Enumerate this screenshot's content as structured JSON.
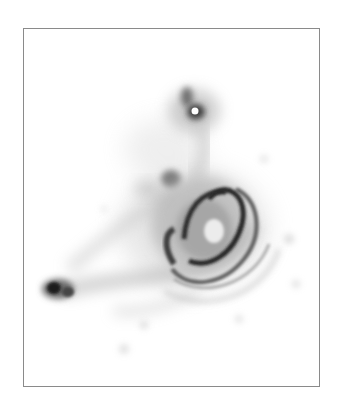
{
  "image": {
    "caption": "",
    "subject": "inverted-grayscale spiral galaxy with tidal tail and companion",
    "colors": {
      "background": "#ffffff",
      "frame": "#8a8a8a",
      "ink_dark": "#1a1a1a",
      "ink_mid": "#6a6a6a",
      "ink_light": "#c8c8c8"
    }
  }
}
